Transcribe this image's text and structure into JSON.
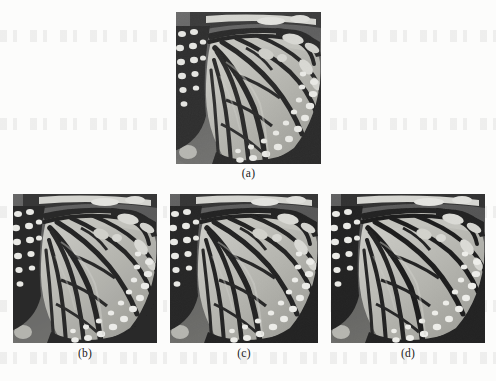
{
  "figure": {
    "kind": "multi-panel-image-figure",
    "background_color": "#fcfcfb",
    "panel_count": 4,
    "panels": [
      {
        "id": "a",
        "caption": "(a)",
        "role": "original",
        "x": 176,
        "y": 12,
        "width": 145,
        "height": 152,
        "palette": {
          "vein_dark": "#2b2b2b",
          "wing_mid": "#a8a8a2",
          "wing_light": "#c8c8c2",
          "spot_white": "#e8e8e4",
          "background_dark": "#5a5a5a",
          "background_mid": "#7a7a78"
        }
      },
      {
        "id": "b",
        "caption": "(b)",
        "role": "processed-variant-1",
        "x": 13,
        "y": 194,
        "width": 144,
        "height": 149,
        "palette": {
          "vein_dark": "#262626",
          "wing_mid": "#a4a49e",
          "wing_light": "#c6c6c0",
          "spot_white": "#ececE8",
          "background_dark": "#545454",
          "background_mid": "#767674"
        }
      },
      {
        "id": "c",
        "caption": "(c)",
        "role": "processed-variant-2",
        "x": 170,
        "y": 194,
        "width": 148,
        "height": 149,
        "palette": {
          "vein_dark": "#242424",
          "wing_mid": "#a6a6a0",
          "wing_light": "#c7c7c1",
          "spot_white": "#ededE9",
          "background_dark": "#525252",
          "background_mid": "#757573"
        }
      },
      {
        "id": "d",
        "caption": "(d)",
        "role": "processed-variant-3",
        "x": 331,
        "y": 194,
        "width": 154,
        "height": 149,
        "palette": {
          "vein_dark": "#222222",
          "wing_mid": "#a5a59f",
          "wing_light": "#c9c9c3",
          "spot_white": "#eeeeea",
          "background_dark": "#505050",
          "background_mid": "#747472"
        }
      }
    ],
    "captions": {
      "a": "(a)",
      "b": "(b)",
      "c": "(c)",
      "d": "(d)"
    }
  }
}
